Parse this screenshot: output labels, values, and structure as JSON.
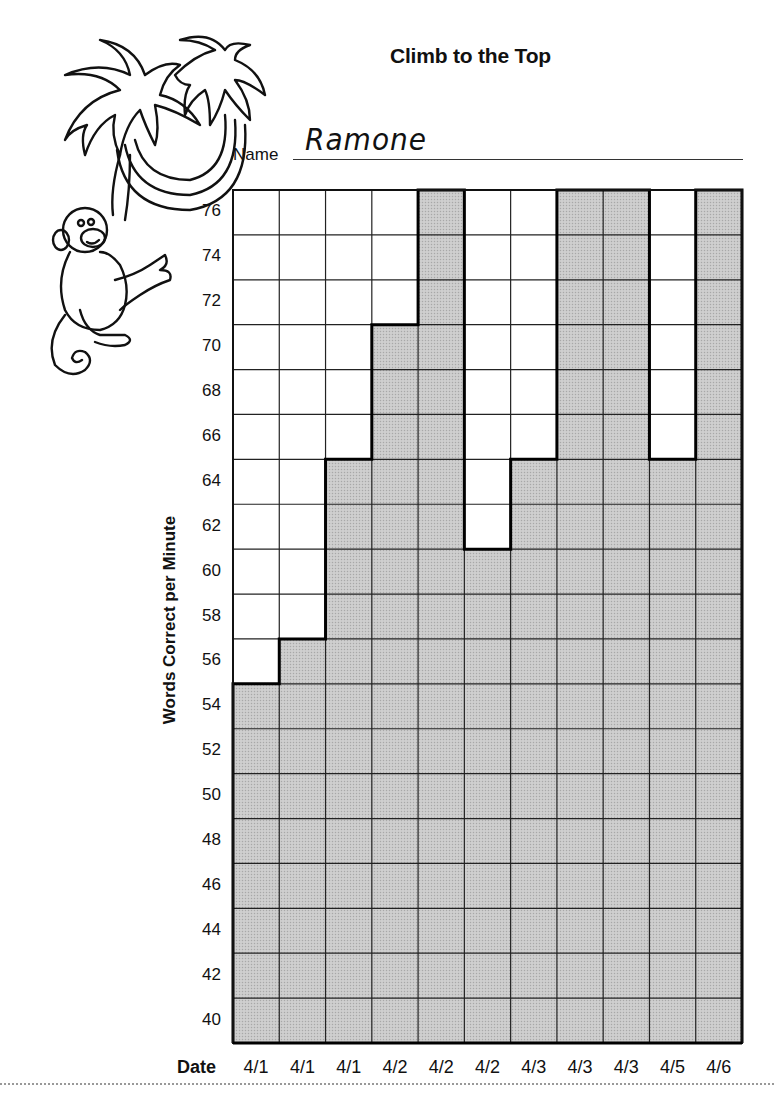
{
  "header": {
    "title": "Climb to the Top",
    "name_label": "Name",
    "name_value": "Ramone"
  },
  "axes": {
    "y_label": "Words Correct per Minute",
    "x_label": "Date"
  },
  "colors": {
    "fill": "#c9c9c9",
    "grid": "#222222",
    "outline": "#000000"
  },
  "chart_data": {
    "type": "bar",
    "title": "Climb to the Top",
    "subtitle": "Name: Ramone",
    "xlabel": "Date",
    "ylabel": "Words Correct per Minute",
    "categories": [
      "4/1",
      "4/1",
      "4/1",
      "4/2",
      "4/2",
      "4/2",
      "4/3",
      "4/3",
      "4/3",
      "4/5",
      "4/6"
    ],
    "values": [
      55,
      57,
      65,
      71,
      77,
      61,
      65,
      77,
      77,
      65,
      77
    ],
    "ylim": [
      39,
      77
    ],
    "yticks": [
      76,
      74,
      72,
      70,
      68,
      66,
      64,
      62,
      60,
      58,
      56,
      54,
      52,
      50,
      48,
      46,
      44,
      42,
      40
    ],
    "grid": true,
    "legend": null
  }
}
